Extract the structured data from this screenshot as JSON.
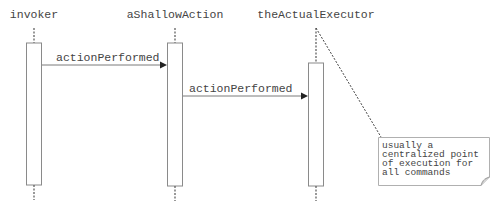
{
  "diagram": {
    "type": "sequence",
    "colors": {
      "line": "#7a7a7a",
      "text": "#444444",
      "background": "#ffffff",
      "note_fill": "#ffffff"
    },
    "participants": [
      {
        "id": "invoker",
        "label": "invoker"
      },
      {
        "id": "aShallowAction",
        "label": "aShallowAction"
      },
      {
        "id": "theActualExecutor",
        "label": "theActualExecutor"
      }
    ],
    "messages": [
      {
        "from": "invoker",
        "to": "aShallowAction",
        "label": "actionPerformed"
      },
      {
        "from": "aShallowAction",
        "to": "theActualExecutor",
        "label": "actionPerformed"
      }
    ],
    "note": {
      "attached_to": "theActualExecutor",
      "lines": [
        "usually a",
        "centralized point",
        "of execution for",
        "all commands"
      ]
    }
  }
}
